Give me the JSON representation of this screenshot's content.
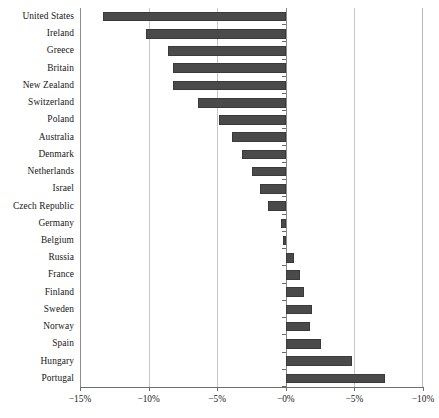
{
  "chart_data": {
    "type": "bar",
    "orientation": "horizontal",
    "title": "",
    "subtitle": "",
    "xlabel": "",
    "ylabel": "",
    "xlim": [
      -15,
      10
    ],
    "grid": true,
    "legend": null,
    "bar_color": "#4a4a4a",
    "zero_reference": 0,
    "xticks": [
      -15,
      -10,
      -5,
      0,
      5,
      10
    ],
    "xtick_labels": [
      "−15%",
      "−10%",
      "−5%",
      "−0%",
      "−5%",
      "−10%"
    ],
    "categories": [
      "United States",
      "Ireland",
      "Greece",
      "Britain",
      "New Zealand",
      "Switzerland",
      "Poland",
      "Australia",
      "Denmark",
      "Netherlands",
      "Israel",
      "Czech Republic",
      "Germany",
      "Belgium",
      "Russia",
      "France",
      "Finland",
      "Sweden",
      "Norway",
      "Spain",
      "Hungary",
      "Portugal"
    ],
    "values": [
      -13.3,
      -10.2,
      -8.6,
      -8.2,
      -8.2,
      -6.4,
      -4.9,
      -3.9,
      -3.2,
      -2.5,
      -1.9,
      -1.3,
      -0.35,
      -0.2,
      0.6,
      1.0,
      1.3,
      1.9,
      1.8,
      2.6,
      4.8,
      7.2
    ]
  }
}
